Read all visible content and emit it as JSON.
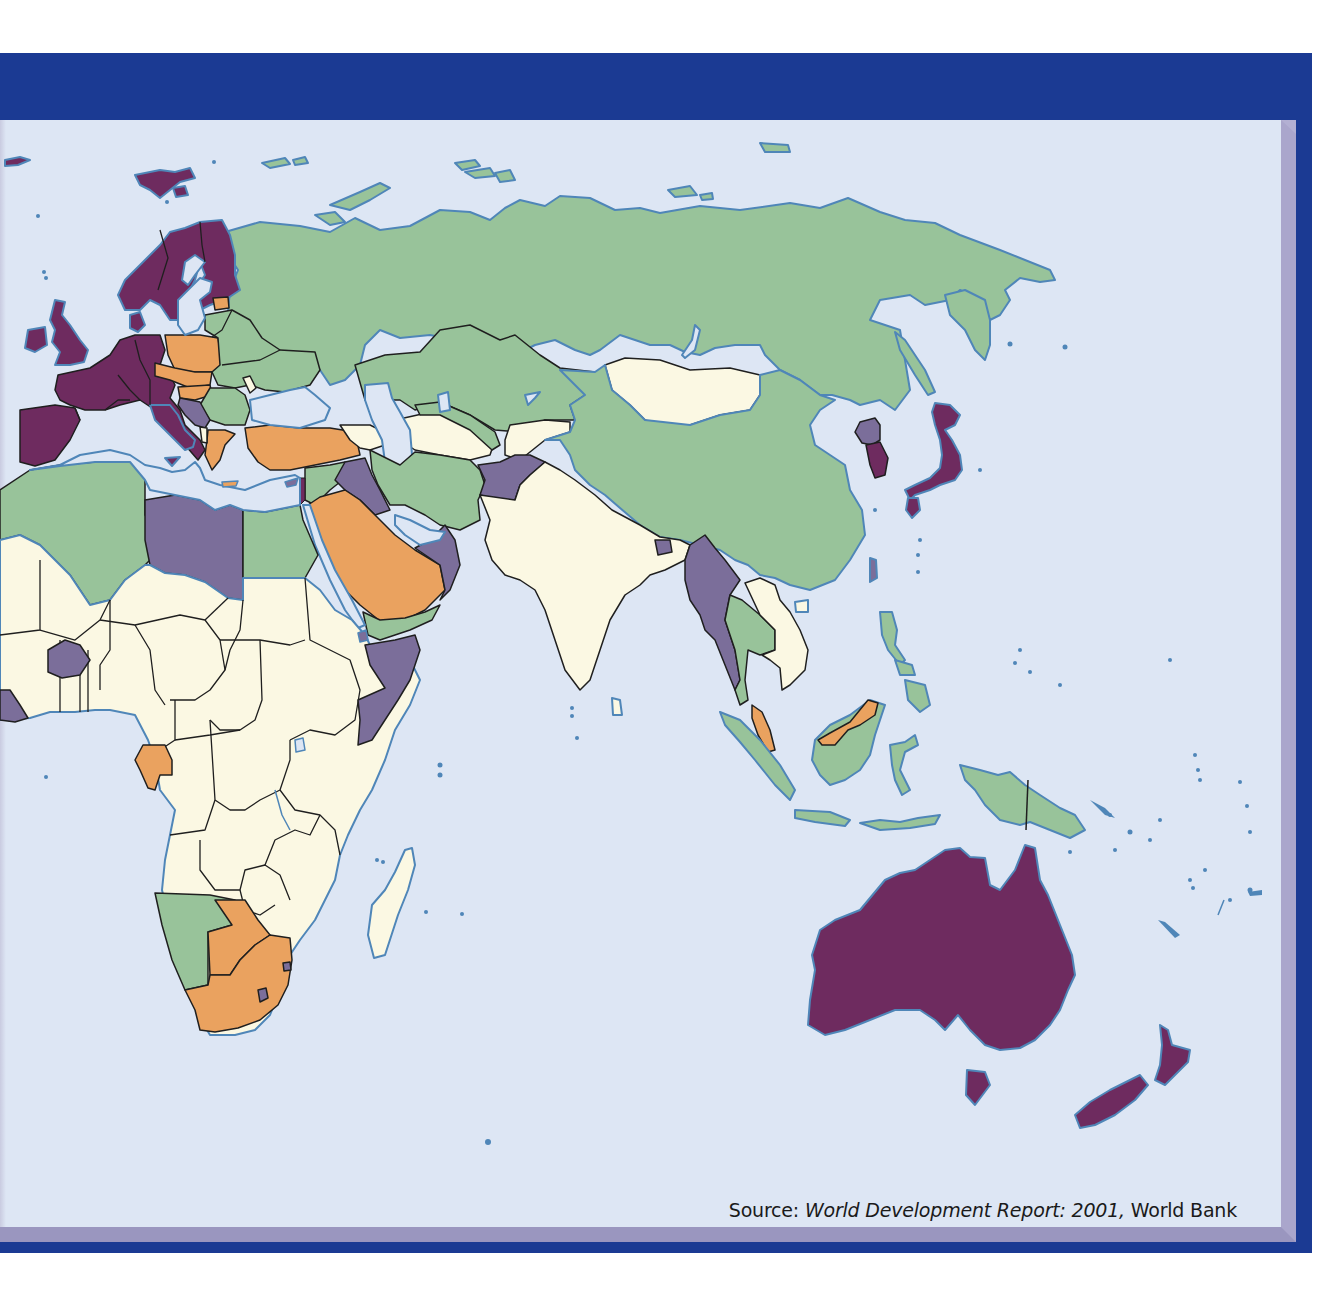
{
  "figure": {
    "type": "choropleth world map (Eastern Hemisphere)",
    "source_label": "Source:",
    "source_title": "World Development Report: 2001,",
    "source_org": "World Bank"
  },
  "colors": {
    "frame_blue": "#1b3a93",
    "bevel": "#9a96bf",
    "sea": "#dde6f4",
    "coast": "#4f86b8",
    "border": "#1f1f1f",
    "cat_deep_purple": "#6e2b5f",
    "cat_gray_purple": "#7b6e9a",
    "cat_orange": "#eaa25f",
    "cat_green": "#98c39a",
    "cat_cream": "#fbf8e3"
  },
  "legend_categories": [
    {
      "id": "deep_purple",
      "color": "#6e2b5f"
    },
    {
      "id": "gray_purple",
      "color": "#7b6e9a"
    },
    {
      "id": "orange",
      "color": "#eaa25f"
    },
    {
      "id": "green",
      "color": "#98c39a"
    },
    {
      "id": "cream",
      "color": "#fbf8e3"
    }
  ],
  "regions": {
    "deep_purple": [
      "Norway",
      "Sweden",
      "Finland",
      "Iceland",
      "Svalbard",
      "United Kingdom",
      "Ireland",
      "France",
      "Germany",
      "Spain",
      "Portugal",
      "Italy",
      "Austria",
      "Switzerland",
      "Denmark",
      "Benelux",
      "Japan",
      "South Korea",
      "Australia",
      "New Zealand",
      "Israel",
      "Kuwait"
    ],
    "gray_purple": [
      "Bosnia/Serbia (former Yugoslavia)",
      "Libya",
      "Iraq",
      "Afghanistan",
      "Myanmar",
      "North Korea",
      "Oman/UAE",
      "Somalia",
      "Burkina Faso",
      "Guinea",
      "Lesotho",
      "Swaziland",
      "Bangladesh/Bhutan",
      "Taiwan",
      "Eritrea"
    ],
    "orange": [
      "Estonia",
      "Poland",
      "Czech Republic",
      "Slovakia",
      "Hungary",
      "Greece",
      "Turkey",
      "Saudi Arabia",
      "Malaysia",
      "Gabon",
      "Botswana",
      "South Africa"
    ],
    "green": [
      "Russia",
      "Belarus",
      "Ukraine",
      "Latvia",
      "Lithuania",
      "Romania",
      "Kazakhstan",
      "Uzbekistan",
      "Turkmenistan (part)",
      "Iran",
      "Syria",
      "Jordan",
      "Egypt",
      "Algeria",
      "Morocco",
      "Tunisia",
      "China",
      "Thailand",
      "Indonesia",
      "Philippines",
      "Papua New Guinea",
      "Namibia",
      "Yemen",
      "Croatia/Bulgaria area"
    ],
    "cream": [
      "Mongolia",
      "India",
      "Pakistan",
      "Kyrgyzstan",
      "Tajikistan",
      "Azerbaijan",
      "Armenia/Georgia",
      "Moldova",
      "Albania",
      "Laos",
      "Vietnam",
      "Cambodia",
      "Sri Lanka",
      "Madagascar",
      "Sub-Saharan Africa (most)",
      "Ethiopia",
      "Sudan",
      "Nepal"
    ]
  }
}
